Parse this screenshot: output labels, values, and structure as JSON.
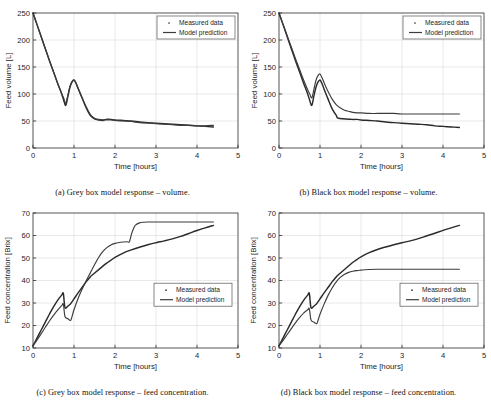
{
  "figure": {
    "panel_count": 4,
    "legend": {
      "measured_label": "Measured data",
      "model_label": "Model prediction",
      "measured_marker": "dot-marker",
      "model_marker": "line-marker"
    },
    "colors": {
      "measured": "#2a2a2a",
      "prediction": "#3c3c3c",
      "grid": "#d2d2d2",
      "axis": "#2b2b2b",
      "background": "#ffffff"
    }
  },
  "panels": [
    {
      "id": "a",
      "caption": "(a) Grey box model response – volume.",
      "chart_data": {
        "type": "line",
        "title": "",
        "xlabel": "Time [hours]",
        "ylabel": "Feed volume [L]",
        "xlim": [
          0,
          5
        ],
        "ylim": [
          0,
          250
        ],
        "xticks": [
          0,
          1,
          2,
          3,
          4,
          5
        ],
        "yticks": [
          0,
          50,
          100,
          150,
          200,
          250
        ],
        "xticklabels": [
          "0",
          "1",
          "2",
          "3",
          "4",
          "5"
        ],
        "yticklabels": [
          "0",
          "50",
          "100",
          "150",
          "200",
          "250"
        ],
        "grid": true,
        "legend_position": "top-right",
        "series": [
          {
            "name": "Measured data",
            "x": [
              0.0,
              0.1,
              0.2,
              0.3,
              0.4,
              0.5,
              0.6,
              0.7,
              0.75,
              0.8,
              0.85,
              0.9,
              0.95,
              1.0,
              1.05,
              1.1,
              1.2,
              1.3,
              1.4,
              1.5,
              1.6,
              1.7,
              1.78,
              1.9,
              2.0,
              2.2,
              2.4,
              2.6,
              2.8,
              3.0,
              3.2,
              3.4,
              3.6,
              3.8,
              4.0,
              4.2,
              4.4
            ],
            "y": [
              250,
              228,
              206,
              184,
              162,
              141,
              120,
              100,
              88,
              79,
              95,
              112,
              122,
              126,
              120,
              110,
              92,
              74,
              60,
              54,
              52,
              51,
              53,
              53,
              52,
              51,
              50,
              48,
              47,
              46,
              45,
              44,
              43,
              42,
              41,
              40,
              39
            ]
          },
          {
            "name": "Model prediction",
            "x": [
              0.0,
              0.1,
              0.2,
              0.3,
              0.4,
              0.5,
              0.6,
              0.7,
              0.75,
              0.8,
              0.85,
              0.9,
              0.95,
              1.0,
              1.05,
              1.1,
              1.2,
              1.3,
              1.4,
              1.5,
              1.6,
              1.7,
              1.8,
              1.9,
              2.0,
              2.2,
              2.4,
              2.6,
              2.8,
              3.0,
              3.2,
              3.4,
              3.6,
              3.8,
              4.0,
              4.2,
              4.4
            ],
            "y": [
              250,
              228,
              206,
              184,
              162,
              141,
              120,
              101,
              92,
              83,
              98,
              114,
              123,
              126,
              120,
              111,
              93,
              76,
              62,
              55,
              53,
              52,
              52,
              52,
              51,
              50,
              49,
              47,
              46,
              45,
              44,
              43,
              42,
              42,
              41,
              41,
              42
            ]
          }
        ]
      }
    },
    {
      "id": "b",
      "caption": "(b) Black box model response – volume.",
      "chart_data": {
        "type": "line",
        "title": "",
        "xlabel": "Time [hours]",
        "ylabel": "Feed volume [L]",
        "xlim": [
          0,
          5
        ],
        "ylim": [
          0,
          250
        ],
        "xticks": [
          0,
          1,
          2,
          3,
          4,
          5
        ],
        "yticks": [
          0,
          50,
          100,
          150,
          200,
          250
        ],
        "xticklabels": [
          "0",
          "1",
          "2",
          "3",
          "4",
          "5"
        ],
        "yticklabels": [
          "0",
          "50",
          "100",
          "150",
          "200",
          "250"
        ],
        "grid": true,
        "legend_position": "top-right",
        "series": [
          {
            "name": "Measured data",
            "x": [
              0.0,
              0.1,
              0.2,
              0.3,
              0.4,
              0.5,
              0.6,
              0.7,
              0.75,
              0.8,
              0.85,
              0.9,
              0.95,
              1.0,
              1.05,
              1.1,
              1.2,
              1.3,
              1.4,
              1.45,
              1.78,
              1.9,
              2.0,
              2.2,
              2.4,
              2.6,
              2.8,
              3.0,
              3.2,
              3.4,
              3.6,
              3.8,
              4.0,
              4.2,
              4.4
            ],
            "y": [
              250,
              228,
              206,
              184,
              162,
              141,
              120,
              100,
              88,
              79,
              96,
              112,
              122,
              126,
              119,
              109,
              90,
              72,
              60,
              55,
              53,
              53,
              52,
              51,
              50,
              48,
              47,
              46,
              45,
              44,
              43,
              41,
              40,
              39,
              38
            ]
          },
          {
            "name": "Model prediction",
            "x": [
              0.0,
              0.1,
              0.2,
              0.3,
              0.4,
              0.5,
              0.6,
              0.7,
              0.75,
              0.8,
              0.85,
              0.9,
              0.95,
              1.0,
              1.05,
              1.1,
              1.2,
              1.3,
              1.4,
              1.5,
              1.6,
              1.7,
              1.8,
              1.9,
              2.0,
              2.2,
              2.4,
              2.6,
              2.8,
              3.0,
              3.4,
              3.8,
              4.2,
              4.4
            ],
            "y": [
              250,
              229,
              208,
              187,
              166,
              146,
              126,
              108,
              100,
              93,
              108,
              125,
              134,
              137,
              130,
              121,
              104,
              90,
              80,
              74,
              70,
              68,
              66,
              65,
              65,
              64,
              64,
              64,
              64,
              63,
              63,
              63,
              63,
              63
            ]
          }
        ]
      }
    },
    {
      "id": "c",
      "caption": "(c) Grey box model response – feed concentration.",
      "chart_data": {
        "type": "line",
        "title": "",
        "xlabel": "Time [hours]",
        "ylabel": "Feed concentration [Brix]",
        "xlim": [
          0,
          5
        ],
        "ylim": [
          10,
          70
        ],
        "xticks": [
          0,
          1,
          2,
          3,
          4,
          5
        ],
        "yticks": [
          10,
          20,
          30,
          40,
          50,
          60,
          70
        ],
        "xticklabels": [
          "0",
          "1",
          "2",
          "3",
          "4",
          "5"
        ],
        "yticklabels": [
          "10",
          "20",
          "30",
          "40",
          "50",
          "60",
          "70"
        ],
        "grid": true,
        "legend_position": "middle-right",
        "series": [
          {
            "name": "Measured data",
            "x": [
              0.0,
              0.1,
              0.2,
              0.3,
              0.4,
              0.5,
              0.6,
              0.7,
              0.74,
              0.78,
              0.85,
              0.9,
              0.95,
              1.0,
              1.1,
              1.2,
              1.3,
              1.4,
              1.43,
              1.78,
              1.9,
              2.0,
              2.2,
              2.4,
              2.6,
              2.8,
              3.0,
              3.2,
              3.4,
              3.6,
              3.8,
              4.0,
              4.2,
              4.4
            ],
            "y": [
              11.0,
              14.5,
              18.0,
              21.5,
              25.0,
              28.3,
              31.2,
              33.5,
              34.2,
              28.0,
              28.6,
              29.3,
              30.5,
              31.8,
              34.5,
              37.0,
              39.5,
              41.7,
              42.2,
              47.5,
              49.0,
              50.3,
              52.2,
              53.6,
              54.8,
              55.9,
              56.8,
              57.6,
              58.5,
              59.6,
              60.9,
              62.2,
              63.4,
              64.5
            ]
          },
          {
            "name": "Model prediction",
            "x": [
              0.0,
              0.1,
              0.2,
              0.3,
              0.4,
              0.5,
              0.6,
              0.7,
              0.74,
              0.78,
              0.85,
              0.92,
              0.96,
              1.0,
              1.1,
              1.2,
              1.3,
              1.4,
              1.5,
              1.6,
              1.7,
              1.8,
              1.9,
              2.0,
              2.1,
              2.2,
              2.3,
              2.35,
              2.4,
              2.45,
              2.5,
              2.6,
              2.7,
              2.8,
              3.0,
              3.4,
              3.8,
              4.2,
              4.4
            ],
            "y": [
              11.0,
              13.6,
              16.4,
              19.2,
              22.0,
              24.5,
              26.8,
              28.8,
              29.5,
              24.0,
              23.0,
              22.3,
              24.5,
              27.0,
              32.0,
              36.2,
              40.0,
              43.5,
              47.0,
              50.2,
              52.8,
              54.6,
              55.8,
              56.5,
              56.9,
              57.1,
              57.2,
              57.2,
              60.5,
              63.0,
              64.6,
              65.6,
              65.9,
              66.0,
              66.0,
              66.0,
              66.0,
              66.0,
              66.0
            ]
          }
        ]
      }
    },
    {
      "id": "d",
      "caption": "(d) Black box model response – feed concentration.",
      "chart_data": {
        "type": "line",
        "title": "",
        "xlabel": "Time [hours]",
        "ylabel": "Feed concentration [Brix]",
        "xlim": [
          0,
          5
        ],
        "ylim": [
          10,
          70
        ],
        "xticks": [
          0,
          1,
          2,
          3,
          4,
          5
        ],
        "yticks": [
          10,
          20,
          30,
          40,
          50,
          60,
          70
        ],
        "xticklabels": [
          "0",
          "1",
          "2",
          "3",
          "4",
          "5"
        ],
        "yticklabels": [
          "10",
          "20",
          "30",
          "40",
          "50",
          "60",
          "70"
        ],
        "grid": true,
        "legend_position": "middle-right",
        "series": [
          {
            "name": "Measured data",
            "x": [
              0.0,
              0.1,
              0.2,
              0.3,
              0.4,
              0.5,
              0.6,
              0.7,
              0.74,
              0.78,
              0.85,
              0.9,
              0.95,
              1.0,
              1.1,
              1.2,
              1.3,
              1.4,
              1.43,
              1.78,
              1.9,
              2.0,
              2.2,
              2.4,
              2.6,
              2.8,
              3.0,
              3.2,
              3.4,
              3.6,
              3.8,
              4.0,
              4.2,
              4.4
            ],
            "y": [
              11.0,
              14.5,
              18.0,
              21.5,
              25.0,
              28.3,
              31.2,
              33.5,
              34.2,
              28.0,
              28.6,
              29.3,
              30.5,
              31.8,
              34.5,
              37.0,
              39.5,
              41.7,
              42.2,
              47.8,
              49.3,
              50.5,
              52.4,
              53.8,
              54.9,
              55.9,
              56.8,
              57.6,
              58.6,
              59.8,
              61.0,
              62.3,
              63.4,
              64.5
            ]
          },
          {
            "name": "Model prediction",
            "x": [
              0.0,
              0.1,
              0.2,
              0.3,
              0.4,
              0.5,
              0.6,
              0.7,
              0.74,
              0.78,
              0.85,
              0.92,
              0.96,
              1.0,
              1.1,
              1.2,
              1.3,
              1.4,
              1.5,
              1.6,
              1.7,
              1.8,
              1.9,
              2.0,
              2.1,
              2.2,
              2.4,
              2.6,
              2.8,
              3.0,
              3.4,
              3.8,
              4.2,
              4.4
            ],
            "y": [
              11.0,
              13.4,
              16.0,
              18.6,
              21.2,
              23.5,
              25.5,
              27.0,
              27.4,
              22.5,
              21.5,
              20.8,
              22.8,
              25.0,
              29.5,
              33.5,
              36.8,
              39.5,
              41.5,
              42.8,
              43.6,
              44.1,
              44.4,
              44.6,
              44.8,
              44.9,
              45.0,
              45.0,
              45.0,
              45.0,
              45.0,
              45.0,
              45.0,
              45.0
            ]
          }
        ]
      }
    }
  ]
}
